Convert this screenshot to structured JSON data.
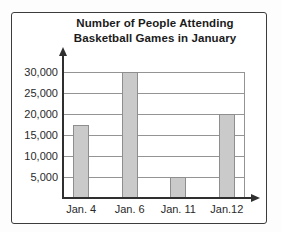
{
  "chart_data": {
    "type": "bar",
    "title": "Number of People Attending Basketball Games in January",
    "title_lines": [
      "Number of People Attending",
      "Basketball Games in January"
    ],
    "categories": [
      "Jan. 4",
      "Jan. 6",
      "Jan. 11",
      "Jan.12"
    ],
    "values": [
      17500,
      30000,
      5000,
      20000
    ],
    "xlabel": "",
    "ylabel": "",
    "ylim": [
      0,
      30000
    ],
    "yticks": [
      5000,
      10000,
      15000,
      20000,
      25000,
      30000
    ],
    "ytick_labels": [
      "5,000",
      "10,000",
      "15,000",
      "20,000",
      "25,000",
      "30,000"
    ],
    "grid": true,
    "legend": false,
    "bar_fill": "#cacaca",
    "bar_border": "#8e8e8e",
    "axis_color": "#2f2f2f",
    "gridline_color": "#949494",
    "frame_border_color": "#3c3c3c"
  }
}
